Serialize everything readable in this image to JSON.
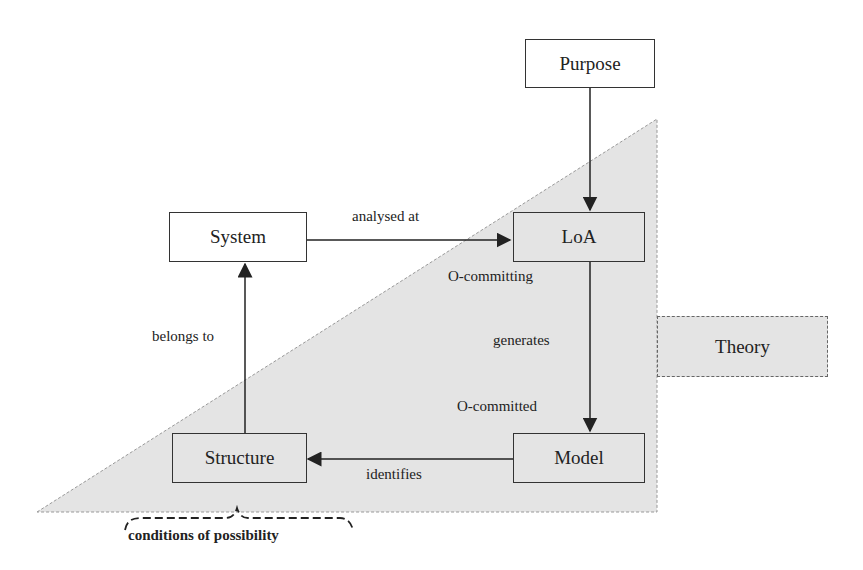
{
  "nodes": {
    "purpose": "Purpose",
    "system": "System",
    "loa": "LoA",
    "model": "Model",
    "structure": "Structure",
    "theory": "Theory"
  },
  "edges": {
    "analysed_at": "analysed at",
    "o_committing": "O-committing",
    "generates": "generates",
    "o_committed": "O-committed",
    "identifies": "identifies",
    "belongs_to": "belongs to"
  },
  "annotation": {
    "conditions": "conditions of possibility"
  },
  "colors": {
    "triangle_fill": "#e4e4e4",
    "line": "#222222"
  }
}
